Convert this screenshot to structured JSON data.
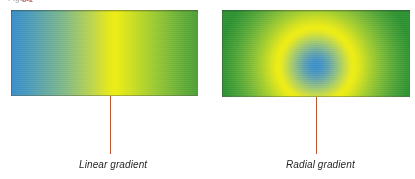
{
  "figure": {
    "caption_remnant_prefix": "Figure",
    "caption_remnant_accent": "6-1",
    "caption_remnant_suffix": "Gradient types"
  },
  "swatches": [
    {
      "id": "linear",
      "name": "linear-gradient-swatch",
      "caption": "Linear gradient",
      "gradient_type": "linear",
      "direction": "to right",
      "stops": [
        {
          "color": "#3a8dcb",
          "position": "0%"
        },
        {
          "color": "#4f9cba",
          "position": "10%"
        },
        {
          "color": "#7fb889",
          "position": "28%"
        },
        {
          "color": "#b7d254",
          "position": "42%"
        },
        {
          "color": "#e4e81e",
          "position": "52%"
        },
        {
          "color": "#eded16",
          "position": "56%"
        },
        {
          "color": "#cfe023",
          "position": "64%"
        },
        {
          "color": "#9ecb34",
          "position": "76%"
        },
        {
          "color": "#6ab13c",
          "position": "90%"
        },
        {
          "color": "#4f9f38",
          "position": "100%"
        }
      ]
    },
    {
      "id": "radial",
      "name": "radial-gradient-swatch",
      "caption": "Radial gradient",
      "gradient_type": "radial",
      "center": "50% 64%",
      "stops": [
        {
          "color": "#3d8fc9",
          "position": "0%"
        },
        {
          "color": "#4794c3",
          "position": "6%"
        },
        {
          "color": "#62a3ae",
          "position": "13%"
        },
        {
          "color": "#8dbd86",
          "position": "21%"
        },
        {
          "color": "#bcd654",
          "position": "29%"
        },
        {
          "color": "#e6e822",
          "position": "36%"
        },
        {
          "color": "#eeee15",
          "position": "40%"
        },
        {
          "color": "#d6e220",
          "position": "47%"
        },
        {
          "color": "#a8cf30",
          "position": "57%"
        },
        {
          "color": "#79b93a",
          "position": "70%"
        },
        {
          "color": "#4ea33a",
          "position": "85%"
        },
        {
          "color": "#2f9234",
          "position": "100%"
        }
      ]
    }
  ],
  "leaders": {
    "color": "#c0562e",
    "linear_label": "linear-gradient-leader-line",
    "radial_label": "radial-gradient-leader-line"
  }
}
